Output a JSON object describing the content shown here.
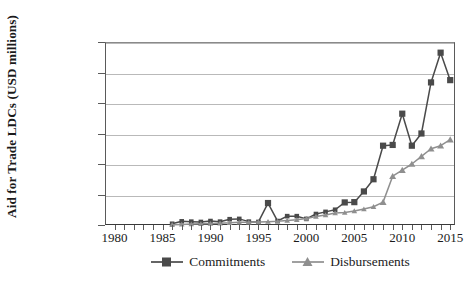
{
  "chart_data": {
    "type": "line",
    "title": "",
    "subtitle": "",
    "xlabel": "",
    "ylabel": "Aid for Trade LDCs (USD millions)",
    "xlim": [
      1979,
      2015.5
    ],
    "ylim": [
      0,
      1200
    ],
    "grid": "horizontal",
    "legend_position": "bottom-center",
    "x_tick_labels": [
      "1980",
      "1985",
      "1990",
      "1995",
      "2000",
      "2005",
      "2010",
      "2015"
    ],
    "x_tick_values": [
      1980,
      1985,
      1990,
      1995,
      2000,
      2005,
      2010,
      2015
    ],
    "x_minor_tick_interval": 1,
    "y_tick_labels": [
      "0",
      "200",
      "400",
      "600",
      "800",
      "1,000",
      "1,200"
    ],
    "y_tick_values": [
      0,
      200,
      400,
      600,
      800,
      1000,
      1200
    ],
    "x": [
      1986,
      1987,
      1988,
      1989,
      1990,
      1991,
      1992,
      1993,
      1994,
      1995,
      1996,
      1997,
      1998,
      1999,
      2000,
      2001,
      2002,
      2003,
      2004,
      2005,
      2006,
      2007,
      2008,
      2009,
      2010,
      2011,
      2012,
      2013,
      2014,
      2015
    ],
    "series": [
      {
        "name": "Commitments",
        "marker": "square",
        "color": "#4a4a4a",
        "values": [
          8,
          24,
          22,
          20,
          26,
          22,
          38,
          40,
          22,
          20,
          144,
          26,
          58,
          58,
          40,
          72,
          86,
          100,
          148,
          150,
          220,
          300,
          520,
          525,
          730,
          520,
          600,
          935,
          1130,
          950
        ]
      },
      {
        "name": "Disbursements",
        "marker": "triangle",
        "color": "#8f8f8f",
        "values": [
          2,
          4,
          6,
          8,
          10,
          12,
          14,
          18,
          18,
          20,
          22,
          24,
          30,
          34,
          42,
          56,
          66,
          78,
          82,
          92,
          105,
          120,
          150,
          320,
          360,
          400,
          450,
          500,
          520,
          560
        ]
      }
    ],
    "annotations": []
  },
  "legend": {
    "items": [
      {
        "label": "Commitments",
        "marker": "square-marker-icon"
      },
      {
        "label": "Disbursements",
        "marker": "triangle-marker-icon"
      }
    ]
  },
  "colors": {
    "commitments": "#4a4a4a",
    "disbursements": "#8f8f8f",
    "gridline": "#b9b9b9",
    "axis": "#3a3a3a",
    "text": "#1a1a1a",
    "background": "#ffffff"
  }
}
